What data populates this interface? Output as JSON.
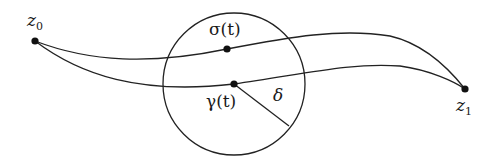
{
  "diagram": {
    "labels": {
      "z0": {
        "base": "z",
        "sub": "0"
      },
      "z1": {
        "base": "z",
        "sub": "1"
      },
      "sigma": "σ(t)",
      "gamma": "γ(t)",
      "delta": "δ"
    },
    "colors": {
      "stroke": "#222222",
      "background": "#ffffff"
    },
    "circle": {
      "cx": 234,
      "cy": 84,
      "r": 71
    },
    "points": {
      "z0": [
        35,
        41
      ],
      "z1": [
        465,
        89
      ],
      "sigma": [
        227,
        49
      ],
      "gamma": [
        234,
        84
      ]
    }
  }
}
